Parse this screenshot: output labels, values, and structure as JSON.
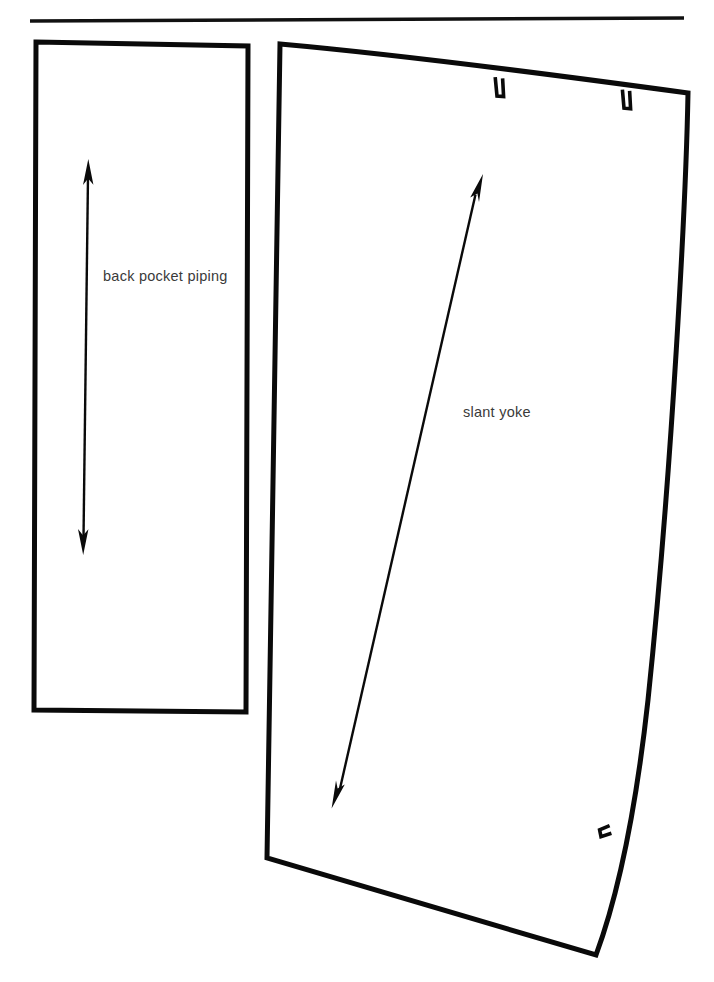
{
  "document": {
    "kind": "sewing-pattern-pieces-diagram",
    "background_color": "#ffffff",
    "ink_color": "#0a0a0a",
    "label_color": "#3a3a3a"
  },
  "divider": {
    "name": "top-horizontal-rule",
    "x1": 30,
    "y1": 21,
    "x2": 684,
    "y2": 18
  },
  "pieces": [
    {
      "id": "back-pocket-piping",
      "label": "back pocket piping",
      "shape": "rectangle",
      "outline_points": "36,42 248,46 246,712 34,710",
      "grainline": {
        "orientation": "vertical",
        "double_headed": true,
        "x1": 88,
        "y1": 162,
        "x2": 83,
        "y2": 552
      },
      "notches": []
    },
    {
      "id": "slant-yoke",
      "label": "slant yoke",
      "shape": "curved-quadrilateral",
      "outline_path": "M 280 44 C 400 56, 540 72, 688 93 C 684 260, 660 560, 634 760 L 596 955 L 267 858 L 280 44 Z",
      "grainline": {
        "orientation": "diagonal",
        "double_headed": true,
        "x1": 332,
        "y1": 808,
        "x2": 483,
        "y2": 175
      },
      "notches": [
        {
          "id": "notch-top-1",
          "edge": "top",
          "x": 499,
          "y": 76
        },
        {
          "id": "notch-top-2",
          "edge": "top",
          "x": 626,
          "y": 89
        },
        {
          "id": "notch-right-1",
          "edge": "right",
          "x": 607,
          "y": 836
        }
      ]
    }
  ],
  "labels": {
    "back_pocket_piping": "back pocket piping",
    "slant_yoke": "slant yoke"
  }
}
